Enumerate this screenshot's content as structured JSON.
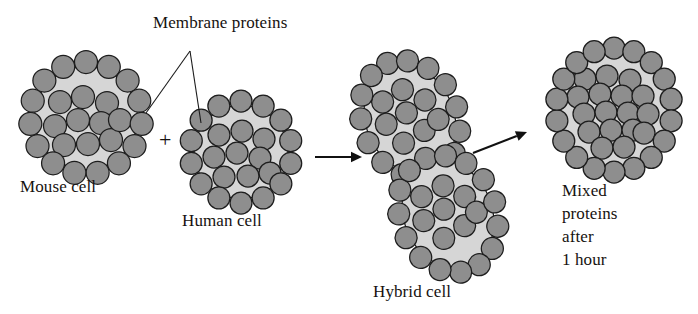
{
  "figure": {
    "width": 698,
    "height": 314,
    "background": "#ffffff"
  },
  "colors": {
    "protein_fill": "#8e8e8e",
    "protein_stroke": "#1d1d1d",
    "cell_fill": "#d6d6d6",
    "cell_stroke": "#1a1a1a",
    "text": "#16120f",
    "arrow": "#111111"
  },
  "labels": {
    "membrane_proteins": "Membrane proteins",
    "mouse_cell": "Mouse cell",
    "human_cell": "Human cell",
    "hybrid_cell": "Hybrid cell",
    "mixed_line_1": "Mixed",
    "mixed_line_2": "proteins",
    "mixed_line_3": "after",
    "mixed_line_4": "1 hour",
    "plus": "+"
  },
  "label_positions": {
    "membrane_proteins": {
      "x": 153,
      "y": 28
    },
    "mouse_cell": {
      "x": 20,
      "y": 192
    },
    "human_cell": {
      "x": 182,
      "y": 226
    },
    "hybrid_cell": {
      "x": 373,
      "y": 297
    },
    "mixed_line_1": {
      "x": 562,
      "y": 196
    },
    "mixed_line_2": {
      "x": 562,
      "y": 219
    },
    "mixed_line_3": {
      "x": 562,
      "y": 242
    },
    "mixed_line_4": {
      "x": 562,
      "y": 265
    },
    "plus": {
      "x": 159,
      "y": 147
    }
  },
  "leader_lines": {
    "origin": {
      "x": 190,
      "y": 51
    },
    "targets": [
      {
        "x": 146,
        "y": 113,
        "name": "mouse-cell-protein"
      },
      {
        "x": 201,
        "y": 123,
        "name": "human-cell-protein"
      }
    ]
  },
  "arrows": [
    {
      "name": "fusion-arrow",
      "x1": 315,
      "y1": 157,
      "x2": 362,
      "y2": 157
    },
    {
      "name": "mixing-arrow",
      "x1": 473,
      "y1": 153,
      "x2": 527,
      "y2": 132
    }
  ],
  "cells": [
    {
      "name": "mouse-cell",
      "cx": 86,
      "cy": 118,
      "rx": 56,
      "ry": 56,
      "rotate": 0,
      "membrane_count": 15,
      "membrane_radius": 11.5,
      "interior_radius": 11.5,
      "interior": [
        {
          "x": -26,
          "y": -16
        },
        {
          "x": -3,
          "y": -21
        },
        {
          "x": 21,
          "y": -15
        },
        {
          "x": -31,
          "y": 8
        },
        {
          "x": -8,
          "y": 2
        },
        {
          "x": 15,
          "y": 5
        },
        {
          "x": -22,
          "y": 27
        },
        {
          "x": 2,
          "y": 26
        },
        {
          "x": 25,
          "y": 22
        },
        {
          "x": 34,
          "y": 2
        }
      ]
    },
    {
      "name": "human-cell",
      "cx": 241,
      "cy": 152,
      "rx": 51,
      "ry": 51,
      "rotate": 0,
      "membrane_count": 14,
      "membrane_radius": 11.0,
      "interior_radius": 11.0,
      "interior": [
        {
          "x": -22,
          "y": -17
        },
        {
          "x": 1,
          "y": -21
        },
        {
          "x": 23,
          "y": -13
        },
        {
          "x": -27,
          "y": 5
        },
        {
          "x": -4,
          "y": 1
        },
        {
          "x": 19,
          "y": 6
        },
        {
          "x": -17,
          "y": 25
        },
        {
          "x": 7,
          "y": 24
        },
        {
          "x": 29,
          "y": 21
        }
      ]
    },
    {
      "name": "hybrid-cell-upper-lobe",
      "cx": 410,
      "cy": 119,
      "rx": 48,
      "ry": 60,
      "rotate": -22,
      "membrane_count": 15,
      "membrane_radius": 11.0,
      "interior_radius": 11.0,
      "interior": [
        {
          "x": -19,
          "y": -26
        },
        {
          "x": 4,
          "y": -30
        },
        {
          "x": -24,
          "y": -4
        },
        {
          "x": -1,
          "y": -7
        },
        {
          "x": 21,
          "y": -12
        },
        {
          "x": -15,
          "y": 20
        },
        {
          "x": 9,
          "y": 16
        },
        {
          "x": 26,
          "y": 11
        }
      ]
    },
    {
      "name": "hybrid-cell-lower-lobe",
      "cx": 448,
      "cy": 214,
      "rx": 48,
      "ry": 60,
      "rotate": -22,
      "membrane_count": 15,
      "membrane_radius": 11.0,
      "interior_radius": 11.0,
      "interior": [
        {
          "x": -18,
          "y": -26
        },
        {
          "x": 6,
          "y": -28
        },
        {
          "x": -25,
          "y": -3
        },
        {
          "x": -2,
          "y": -6
        },
        {
          "x": 22,
          "y": -10
        },
        {
          "x": -13,
          "y": 21
        },
        {
          "x": 11,
          "y": 17
        },
        {
          "x": 27,
          "y": 9
        }
      ]
    },
    {
      "name": "mixed-cell",
      "cx": 614,
      "cy": 110,
      "rx": 58,
      "ry": 62,
      "rotate": 0,
      "membrane_count": 18,
      "membrane_radius": 11.0,
      "interior_radius": 11.0,
      "interior": [
        {
          "x": -29,
          "y": -31
        },
        {
          "x": -7,
          "y": -34
        },
        {
          "x": 16,
          "y": -30
        },
        {
          "x": -36,
          "y": -13
        },
        {
          "x": -14,
          "y": -16
        },
        {
          "x": 8,
          "y": -14
        },
        {
          "x": 29,
          "y": -14
        },
        {
          "x": -30,
          "y": 4
        },
        {
          "x": -8,
          "y": 2
        },
        {
          "x": 14,
          "y": 3
        },
        {
          "x": 34,
          "y": 4
        },
        {
          "x": -25,
          "y": 22
        },
        {
          "x": -3,
          "y": 20
        },
        {
          "x": 19,
          "y": 20
        },
        {
          "x": -12,
          "y": 38
        },
        {
          "x": 10,
          "y": 37
        },
        {
          "x": 30,
          "y": 23
        }
      ]
    }
  ]
}
